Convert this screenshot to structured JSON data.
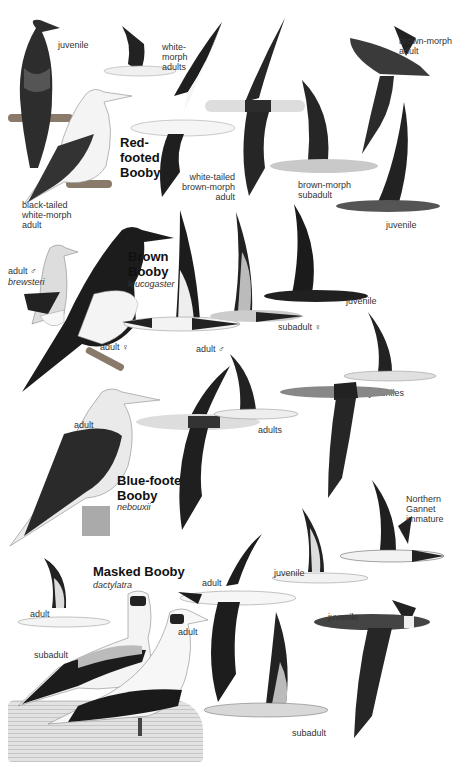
{
  "plate": {
    "background": "#ffffff",
    "ink": "#1a1a1a",
    "species": [
      {
        "title": "Red-\nfooted\nBooby",
        "scientific": "",
        "labels": {
          "juvenile_perched": "juvenile",
          "white_morph_adults": "white-\nmorph\nadults",
          "black_tailed": "black-tailed\nwhite-morph\nadult",
          "white_tailed_brown": "white-tailed\nbrown-morph\nadult",
          "brown_morph_adult": "brown-morph\nadult",
          "brown_morph_subadult": "brown-morph\nsubadult",
          "juvenile_flying": "juvenile"
        }
      },
      {
        "title": "Brown\nBooby",
        "scientific": "leucogaster",
        "labels": {
          "adult_male_brewsteri": "adult ♂",
          "brewsteri": "brewsteri",
          "adult_female": "adult ♀",
          "adult_male_flying": "adult ♂",
          "subadult_female": "subadult ♀",
          "juvenile_upper": "juvenile",
          "juvenile_lower": "juvenile"
        }
      },
      {
        "title": "Blue-footed\nBooby",
        "scientific": "nebouxii",
        "labels": {
          "adult_perched": "adult",
          "adults_flying": "adults",
          "juveniles": "juveniles"
        }
      },
      {
        "title": "",
        "scientific": "",
        "labels": {
          "northern_gannet": "Northern\nGannet\nimmature"
        }
      },
      {
        "title": "Masked Booby",
        "scientific": "dactylatra",
        "labels": {
          "adult_small_flying": "adult",
          "subadult_perched": "subadult",
          "adult_perched": "adult",
          "adult_flying": "adult",
          "juvenile_upper": "juvenile",
          "juvenile_lower": "juvenile",
          "subadult_flying": "subadult"
        }
      }
    ]
  }
}
